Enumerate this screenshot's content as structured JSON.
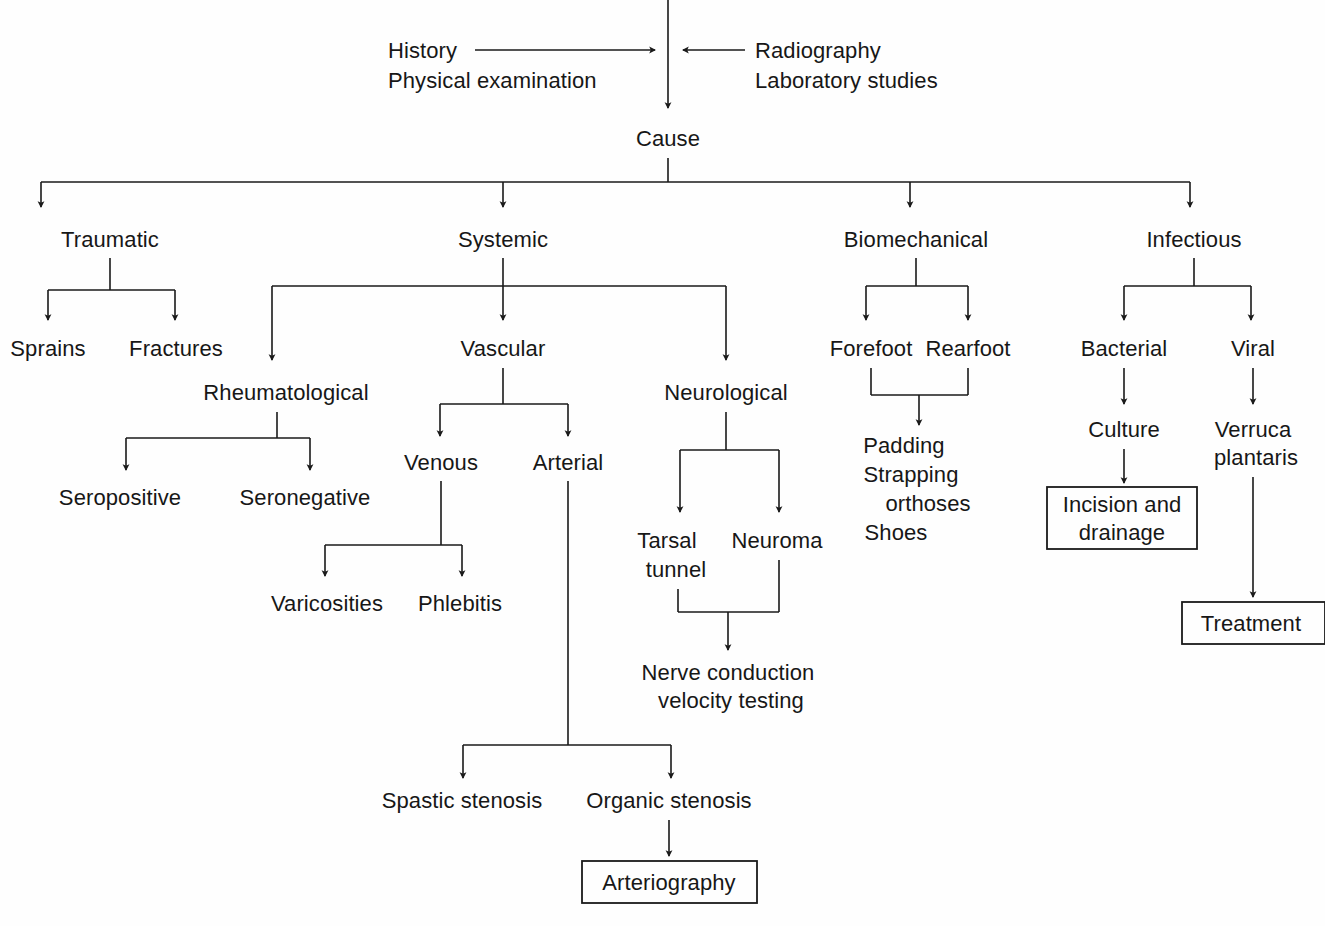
{
  "diagram": {
    "background_color": "#fefefe",
    "line_color": "#1a1a1a",
    "text_color": "#171717",
    "inputs": {
      "left": {
        "line1": "History",
        "line2": "Physical examination"
      },
      "right": {
        "line1": "Radiography",
        "line2": "Laboratory studies"
      }
    },
    "root": "Cause",
    "level1": {
      "traumatic": "Traumatic",
      "systemic": "Systemic",
      "biomechanical": "Biomechanical",
      "infectious": "Infectious"
    },
    "traumatic_branch": {
      "sprains": "Sprains",
      "fractures": "Fractures"
    },
    "systemic_branch": {
      "rheumatological": "Rheumatological",
      "vascular": "Vascular",
      "neurological": "Neurological"
    },
    "rheumatological_branch": {
      "seropositive": "Seropositive",
      "seronegative": "Seronegative"
    },
    "vascular_branch": {
      "venous": "Venous",
      "arterial": "Arterial"
    },
    "venous_branch": {
      "varicosities": "Varicosities",
      "phlebitis": "Phlebitis"
    },
    "arterial_branch": {
      "spastic_stenosis": "Spastic stenosis",
      "organic_stenosis": "Organic stenosis",
      "arteriography": "Arteriography"
    },
    "neurological_branch": {
      "tarsal_tunnel_line1": "Tarsal",
      "tarsal_tunnel_line2": "tunnel",
      "neuroma": "Neuroma",
      "nerve_conduction_line1": "Nerve conduction",
      "nerve_conduction_line2": "velocity testing"
    },
    "biomechanical_branch": {
      "forefoot": "Forefoot",
      "rearfoot": "Rearfoot",
      "treatment_line1": "Padding",
      "treatment_line2": "Strapping",
      "treatment_line3": "orthoses",
      "treatment_line4": "Shoes"
    },
    "infectious_branch": {
      "bacterial": "Bacterial",
      "viral": "Viral",
      "culture": "Culture",
      "verruca_line1": "Verruca",
      "verruca_line2": "plantaris",
      "incision_line1": "Incision and",
      "incision_line2": "drainage",
      "treatment": "Treatment"
    }
  }
}
